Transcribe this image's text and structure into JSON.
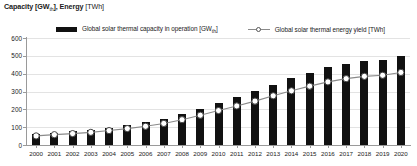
{
  "header": {
    "axis_title_main": "Capacity [GW",
    "axis_title_sub1": "th",
    "axis_title_mid": "], Energy",
    "axis_title_unit": "[TWh]"
  },
  "legend": {
    "items": [
      {
        "label": "Global solar thermal capacity in operation [GW",
        "sub": "th",
        "tail": "]",
        "marker": "filled-bar-swatch",
        "color": "#111111"
      },
      {
        "label": "Global solar thermal energy yield [TWh]",
        "sub": "",
        "tail": "",
        "marker": "line-circle-swatch",
        "color": "#8a8a8a"
      }
    ]
  },
  "chart_data": {
    "type": "bar",
    "title": "Capacity [GWth], Energy [TWh]",
    "xlabel": "",
    "ylabel": "Capacity [GWth], Energy [TWh]",
    "ylim": [
      0,
      600
    ],
    "yticks": [
      0,
      100,
      200,
      300,
      400,
      500,
      600
    ],
    "grid": true,
    "legend_position": "top",
    "categories": [
      "2000",
      "2001",
      "2002",
      "2003",
      "2004",
      "2005",
      "2006",
      "2007",
      "2008",
      "2009",
      "2010",
      "2011",
      "2012",
      "2013",
      "2014",
      "2015",
      "2016",
      "2017",
      "2018",
      "2019",
      "2020"
    ],
    "series": [
      {
        "name": "Global solar thermal capacity in operation [GWth]",
        "type": "bar",
        "color": "#111111",
        "values": [
          62,
          70,
          77,
          86,
          98,
          111,
          127,
          147,
          172,
          203,
          235,
          268,
          302,
          339,
          374,
          405,
          435,
          456,
          472,
          479,
          501
        ]
      },
      {
        "name": "Global solar thermal energy yield [TWh]",
        "type": "line",
        "color": "#8a8a8a",
        "marker": "open-circle",
        "values": [
          51,
          58,
          64,
          71,
          81,
          92,
          105,
          121,
          142,
          167,
          193,
          219,
          246,
          276,
          304,
          330,
          354,
          372,
          385,
          391,
          407
        ]
      }
    ]
  }
}
